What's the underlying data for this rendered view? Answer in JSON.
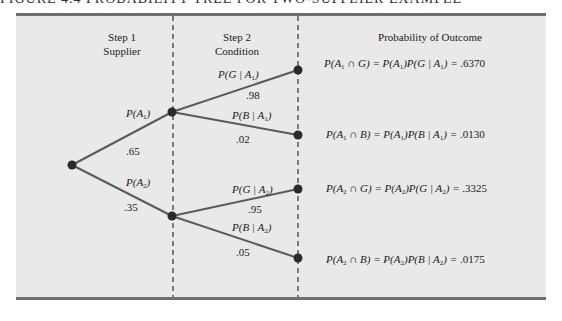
{
  "figure": {
    "title": "FIGURE 4.4   PROBABILITY TREE FOR TWO-SUPPLIER EXAMPLE"
  },
  "headers": {
    "step1_line1": "Step 1",
    "step1_line2": "Supplier",
    "step2_line1": "Step 2",
    "step2_line2": "Condition",
    "outcome": "Probability of Outcome"
  },
  "branches": {
    "a1": {
      "label": "P(A1)",
      "value": ".65"
    },
    "a2": {
      "label": "P(A2)",
      "value": ".35"
    },
    "g_a1": {
      "label": "P(G | A1)",
      "value": ".98"
    },
    "b_a1": {
      "label": "P(B | A1)",
      "value": ".02"
    },
    "g_a2": {
      "label": "P(G | A2)",
      "value": ".95"
    },
    "b_a2": {
      "label": "P(B | A2)",
      "value": ".05"
    }
  },
  "outcomes": [
    {
      "lhs": "P(A1 ∩ G)",
      "rhs": "P(A1)P(G | A1)",
      "value": ".6370"
    },
    {
      "lhs": "P(A1 ∩ B)",
      "rhs": "P(A1)P(B | A1)",
      "value": ".0130"
    },
    {
      "lhs": "P(A2 ∩ G)",
      "rhs": "P(A2)P(G | A2)",
      "value": ".3325"
    },
    {
      "lhs": "P(A2 ∩ B)",
      "rhs": "P(A2)P(B | A2)",
      "value": ".0175"
    }
  ],
  "colors": {
    "panel_bg": "#e9e9e9",
    "border": "#6e6e6e",
    "line": "#5a5a5a",
    "node": "#2a2a2a"
  }
}
